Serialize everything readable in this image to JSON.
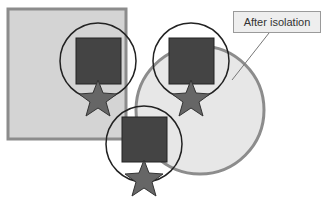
{
  "callout": {
    "label": "After isolation"
  },
  "colors": {
    "square_fill": "#d4d4d4",
    "square_stroke": "#8c8c8c",
    "circle_fill": "#e3e3e3",
    "circle_stroke": "#8c8c8c",
    "group_square": "#444444",
    "group_star": "#666666",
    "group_ring": "#222222"
  },
  "shapes": {
    "background_square": {
      "x": 7,
      "y": 8,
      "w": 120,
      "h": 132
    },
    "background_circle": {
      "cx": 195,
      "cy": 105,
      "r": 65
    },
    "groups": [
      {
        "name": "group-left",
        "cx": 98,
        "cy": 60
      },
      {
        "name": "group-right",
        "cx": 190,
        "cy": 60
      },
      {
        "name": "group-bottom",
        "cx": 138,
        "cy": 143
      }
    ]
  }
}
